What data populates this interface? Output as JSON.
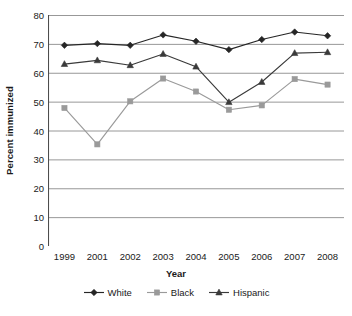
{
  "chart_data": {
    "type": "line",
    "title": "",
    "xlabel": "Year",
    "ylabel": "Percent immunized",
    "categories": [
      "1999",
      "2001",
      "2002",
      "2003",
      "2004",
      "2005",
      "2006",
      "2007",
      "2008"
    ],
    "ylim": [
      0,
      80
    ],
    "ytick_step": 10,
    "yticks": [
      "0",
      "10",
      "20",
      "30",
      "40",
      "50",
      "60",
      "70",
      "80"
    ],
    "grid": "horizontal",
    "legend_position": "bottom",
    "series": [
      {
        "name": "White",
        "marker": "diamond",
        "color": "#262626",
        "values": [
          69.5,
          70.1,
          69.5,
          73.1,
          70.9,
          68.0,
          71.5,
          74.1,
          72.8
        ]
      },
      {
        "name": "Black",
        "marker": "square",
        "color": "#9a9a9a",
        "values": [
          47.8,
          35.2,
          50.1,
          58.0,
          53.5,
          47.2,
          48.7,
          57.8,
          55.9
        ]
      },
      {
        "name": "Hispanic",
        "marker": "triangle",
        "color": "#3a3a3a",
        "values": [
          63.0,
          64.3,
          62.6,
          66.5,
          62.1,
          49.8,
          56.8,
          66.8,
          67.1
        ]
      }
    ]
  },
  "axis": {
    "ylabel_text": "Percent immunized",
    "xlabel_text": "Year"
  },
  "legend": {
    "items": [
      {
        "label": "White"
      },
      {
        "label": "Black"
      },
      {
        "label": "Hispanic"
      }
    ]
  },
  "colors": {
    "white_series": "#262626",
    "black_series": "#9a9a9a",
    "hispanic_series": "#3a3a3a",
    "gridline": "#8c8c8c",
    "axis": "#4d4d4d",
    "text": "#1a1a1a",
    "background": "#ffffff"
  }
}
